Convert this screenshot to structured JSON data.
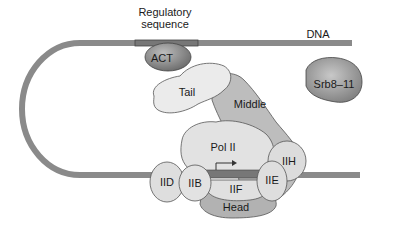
{
  "diagram": {
    "title": "",
    "labels": {
      "regulatory": "Regulatory\nsequence",
      "regulatory_line1": "Regulatory",
      "regulatory_line2": "sequence",
      "dna": "DNA",
      "act": "ACT",
      "tail": "Tail",
      "middle": "Middle",
      "srb": "Srb8–11",
      "pol2": "Pol II",
      "iih": "IIH",
      "iid": "IID",
      "iib": "IIB",
      "iie": "IIE",
      "iif": "IIF",
      "head": "Head"
    },
    "colors": {
      "dna": "#8a8a8a",
      "light_protein": "#e4e4e4",
      "mid_protein": "#b8b8b8",
      "dark_protein": "#7a7a7a",
      "outline": "#555555"
    }
  }
}
